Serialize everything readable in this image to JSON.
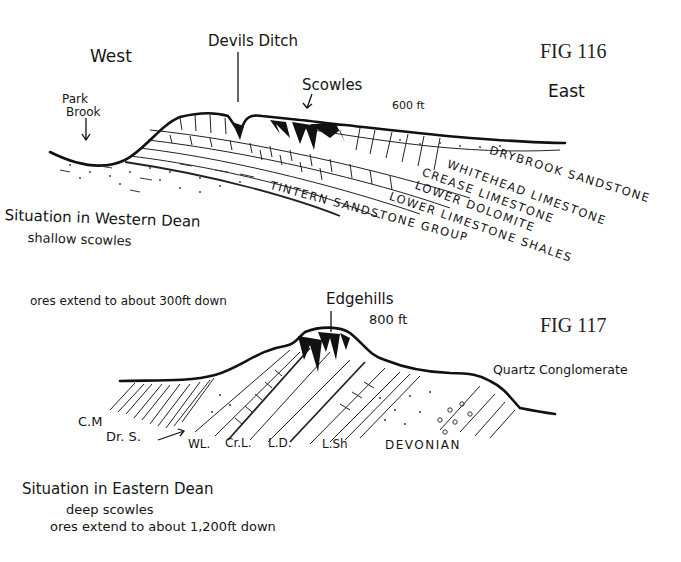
{
  "fig116": {
    "label": "FIG 116",
    "west": "West",
    "east": "East",
    "devils_ditch": "Devils Ditch",
    "scowles": "Scowles",
    "elevation": "600 ft",
    "park_brook_line1": "Park",
    "park_brook_line2": "Brook",
    "layers": [
      "DRYBROOK SANDSTONE",
      "WHITEHEAD LIMESTONE",
      "CREASE LIMESTONE",
      "LOWER DOLOMITE",
      "LOWER LIMESTONE SHALES",
      "TINTERN SANDSTONE GROUP"
    ],
    "caption_line1": "Situation in Western Dean",
    "caption_line2": "shallow scowles"
  },
  "fig117": {
    "label": "FIG 117",
    "ores_note": "ores extend to about 300ft down",
    "edgehills": "Edgehills",
    "elevation": "800 ft",
    "quartz": "Quartz Conglomerate",
    "cm": "C.M",
    "drs": "Dr. S.",
    "abbrev": [
      "WL.",
      "Cr.L.",
      "L.D.",
      "L.Sh",
      "DEVONIAN"
    ],
    "caption_line1": "Situation in Eastern Dean",
    "caption_line2": "deep scowles",
    "caption_line3": "ores extend to about 1,200ft down"
  }
}
